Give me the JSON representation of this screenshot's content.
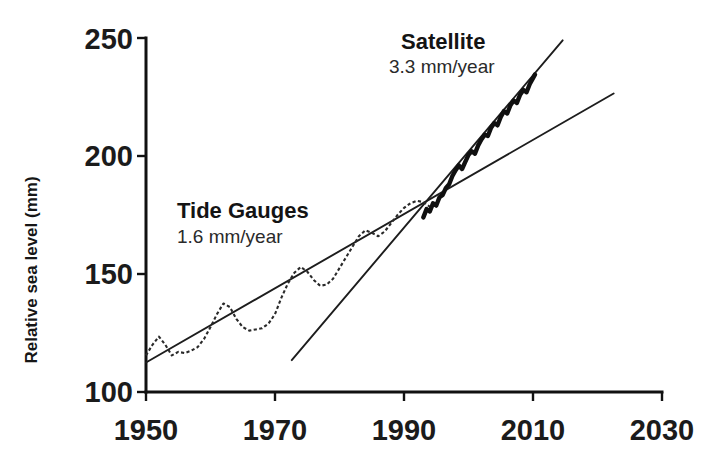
{
  "chart_data": {
    "type": "line",
    "title": "",
    "xlabel": "",
    "ylabel": "Relative sea level (mm)",
    "xlim": [
      1950,
      2030
    ],
    "ylim": [
      100,
      250
    ],
    "xticks": [
      1950,
      1970,
      1990,
      2010,
      2030
    ],
    "yticks": [
      100,
      150,
      200,
      250
    ],
    "xtick_labels": [
      "1950",
      "1970",
      "1990",
      "2010",
      "2030"
    ],
    "ytick_labels": [
      "100",
      "150",
      "200",
      "250"
    ],
    "grid": false,
    "legend": "none",
    "annotations": [
      {
        "name": "tide-gauges-annotation",
        "title": "Tide Gauges",
        "rate": "1.6 mm/year",
        "title_xy": [
          1956.5,
          188
        ],
        "rate_xy": [
          1956.5,
          178
        ]
      },
      {
        "name": "satellite-annotation",
        "title": "Satellite",
        "rate": "3.3 mm/year",
        "title_xy": [
          1986.0,
          248
        ],
        "rate_xy": [
          1985.0,
          238
        ]
      }
    ],
    "series": [
      {
        "name": "Tide Gauges",
        "style": "dotted",
        "x": [
          1950,
          1951,
          1952,
          1953,
          1954,
          1955,
          1956,
          1957,
          1958,
          1959,
          1960,
          1961,
          1962,
          1963,
          1964,
          1965,
          1966,
          1967,
          1968,
          1969,
          1970,
          1971,
          1972,
          1973,
          1974,
          1975,
          1976,
          1977,
          1978,
          1979,
          1980,
          1981,
          1982,
          1983,
          1984,
          1985,
          1986,
          1987,
          1988,
          1989,
          1990,
          1991,
          1992,
          1993,
          1994,
          1995
        ],
        "y": [
          115.5,
          120.0,
          123.5,
          120.0,
          115.5,
          117.0,
          116.5,
          117.5,
          119.0,
          122.5,
          127.5,
          133.0,
          137.5,
          136.0,
          131.0,
          127.5,
          126.0,
          126.5,
          127.0,
          129.0,
          133.0,
          140.0,
          146.0,
          150.5,
          153.0,
          151.0,
          147.5,
          145.0,
          145.5,
          148.0,
          152.5,
          157.0,
          161.5,
          166.0,
          168.5,
          167.5,
          166.0,
          168.0,
          171.5,
          175.0,
          178.0,
          180.0,
          181.0,
          180.5,
          178.5,
          179.0
        ]
      },
      {
        "name": "Satellite",
        "style": "solid-thick",
        "x": [
          1993.0,
          1993.5,
          1994.0,
          1994.5,
          1995.0,
          1995.5,
          1996.0,
          1996.5,
          1997.0,
          1997.5,
          1998.0,
          1998.5,
          1999.0,
          1999.5,
          2000.0,
          2000.5,
          2001.0,
          2001.5,
          2002.0,
          2002.5,
          2003.0,
          2003.5,
          2004.0,
          2004.5,
          2005.0,
          2005.5,
          2006.0,
          2006.5,
          2007.0,
          2007.5,
          2008.0,
          2008.5,
          2009.0,
          2009.5,
          2010.0,
          2010.3
        ],
        "y": [
          174.0,
          177.5,
          176.5,
          180.0,
          179.0,
          182.5,
          183.5,
          186.5,
          188.0,
          191.5,
          194.0,
          196.0,
          194.5,
          197.5,
          200.5,
          202.0,
          201.0,
          204.5,
          207.0,
          209.0,
          208.5,
          212.0,
          214.0,
          213.0,
          216.5,
          219.0,
          218.0,
          221.5,
          223.5,
          222.5,
          226.0,
          228.0,
          227.0,
          230.5,
          233.0,
          234.5
        ]
      }
    ],
    "trend_lines": [
      {
        "name": "tide-gauge-trend",
        "label": "1.6 mm/year",
        "slope_mm_per_year": 1.6,
        "x0": 1950.0,
        "y0": 112.5,
        "x1": 2022.5,
        "y1": 226.5
      },
      {
        "name": "satellite-trend",
        "label": "3.3 mm/year",
        "slope_mm_per_year": 3.3,
        "x0": 1972.6,
        "y0": 113.5,
        "x1": 2014.6,
        "y1": 249.0
      }
    ],
    "colors": {
      "axis": "#111111",
      "tide_series": "#2a2a2a",
      "satellite_series": "#101010",
      "trend": "#1d1d1d",
      "text": "#1a1a1a",
      "background": "#ffffff"
    }
  }
}
